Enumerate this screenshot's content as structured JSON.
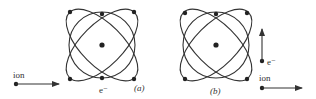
{
  "diagrams": [
    {
      "id": "a",
      "caption": "(a)",
      "electron_label": "e⁻",
      "ion_label": "ion",
      "ion_direction": "right (horizontal)",
      "electron_direction": null
    },
    {
      "id": "b",
      "caption": "(b)",
      "electron_label": "e⁻",
      "ion_label": "ion",
      "ion_direction": "right (horizontal)",
      "electron_direction": "up (vertical)"
    }
  ],
  "colors": {
    "stroke": "#333333",
    "background": "#ffffff"
  }
}
